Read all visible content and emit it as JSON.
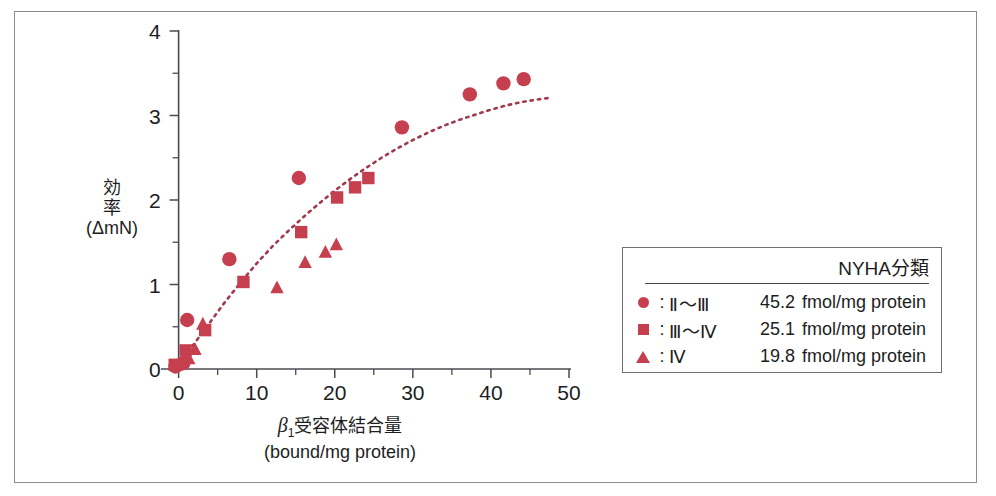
{
  "figure": {
    "frame_color": "#8d8d8d",
    "marker_color": "#c63f4f",
    "curve_color": "#a13a4c"
  },
  "axes": {
    "y_label_line1": "効",
    "y_label_line2": "率",
    "y_label_line3": "(ΔmN)",
    "x_label_beta": "β",
    "x_label_sub": "1",
    "x_label_rest": "受容体結合量",
    "x_label_line2": "(bound/mg protein)",
    "x_ticks": [
      "0",
      "10",
      "20",
      "30",
      "40",
      "50"
    ],
    "y_ticks": [
      "0",
      "1",
      "2",
      "3",
      "4"
    ]
  },
  "legend": {
    "title": "NYHA分類",
    "rows": [
      {
        "marker": "circle-marker",
        "colon": ":",
        "klass": "Ⅱ～Ⅲ",
        "value": "45.2",
        "unit": "fmol/mg protein"
      },
      {
        "marker": "square-marker",
        "colon": ":",
        "klass": "Ⅲ～Ⅳ",
        "value": "25.1",
        "unit": "fmol/mg protein"
      },
      {
        "marker": "triangle-marker",
        "colon": ":",
        "klass": "Ⅳ",
        "value": "19.8",
        "unit": "fmol/mg protein"
      }
    ]
  },
  "chart_data": {
    "type": "scatter",
    "title": "",
    "xlabel": "β1受容体結合量 (bound/mg protein)",
    "ylabel": "効率 (ΔmN)",
    "xlim": [
      -2,
      50
    ],
    "ylim": [
      0,
      4
    ],
    "xticks": [
      0,
      10,
      20,
      30,
      40,
      50
    ],
    "yticks": [
      0,
      1,
      2,
      3,
      4
    ],
    "xminor_step": 5,
    "yminor_step": 0.5,
    "grid": false,
    "legend_position": "right-outside",
    "series": [
      {
        "name": "Ⅱ～Ⅲ 45.2 fmol/mg protein",
        "marker": "circle",
        "color": "#c63f4f",
        "points": [
          [
            -0.4,
            0.03
          ],
          [
            0.6,
            0.07
          ],
          [
            1.1,
            0.58
          ],
          [
            6.5,
            1.3
          ],
          [
            15.4,
            2.26
          ],
          [
            28.6,
            2.86
          ],
          [
            37.3,
            3.25
          ],
          [
            41.6,
            3.38
          ],
          [
            44.2,
            3.43
          ]
        ]
      },
      {
        "name": "Ⅲ～Ⅳ 25.1 fmol/mg protein",
        "marker": "square",
        "color": "#c63f4f",
        "points": [
          [
            -0.5,
            0.05
          ],
          [
            0.9,
            0.22
          ],
          [
            3.4,
            0.46
          ],
          [
            8.3,
            1.03
          ],
          [
            15.7,
            1.62
          ],
          [
            20.3,
            2.03
          ],
          [
            22.6,
            2.15
          ],
          [
            24.3,
            2.26
          ]
        ]
      },
      {
        "name": "Ⅳ 19.8 fmol/mg protein",
        "marker": "triangle",
        "color": "#c63f4f",
        "points": [
          [
            -0.3,
            0.04
          ],
          [
            1.3,
            0.12
          ],
          [
            2.1,
            0.23
          ],
          [
            3.1,
            0.53
          ],
          [
            12.6,
            0.96
          ],
          [
            16.2,
            1.26
          ],
          [
            18.8,
            1.38
          ],
          [
            20.2,
            1.47
          ]
        ]
      }
    ],
    "fit_curve": {
      "name": "dotted-trend-curve",
      "style": "dotted",
      "color": "#a13a4c",
      "points": [
        [
          -0.6,
          0.0
        ],
        [
          2.0,
          0.3
        ],
        [
          4.0,
          0.55
        ],
        [
          6.0,
          0.8
        ],
        [
          8.0,
          1.03
        ],
        [
          10.0,
          1.25
        ],
        [
          12.0,
          1.45
        ],
        [
          14.0,
          1.63
        ],
        [
          16.0,
          1.8
        ],
        [
          18.0,
          1.96
        ],
        [
          20.0,
          2.11
        ],
        [
          22.0,
          2.25
        ],
        [
          24.0,
          2.38
        ],
        [
          26.0,
          2.5
        ],
        [
          28.0,
          2.61
        ],
        [
          30.0,
          2.71
        ],
        [
          32.0,
          2.8
        ],
        [
          34.0,
          2.88
        ],
        [
          36.0,
          2.95
        ],
        [
          38.0,
          3.01
        ],
        [
          40.0,
          3.07
        ],
        [
          42.0,
          3.12
        ],
        [
          44.0,
          3.16
        ],
        [
          46.0,
          3.19
        ],
        [
          47.6,
          3.21
        ]
      ]
    }
  }
}
